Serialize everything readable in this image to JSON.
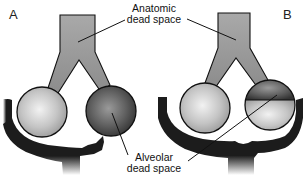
{
  "panels": [
    {
      "letter": "A"
    },
    {
      "letter": "B"
    }
  ],
  "labels": {
    "anatomic_line1": "Anatomic",
    "anatomic_line2": "dead space",
    "alveolar_line1": "Alveolar",
    "alveolar_line2": "dead space"
  },
  "colors": {
    "airway": "#8a8a8a",
    "alveolus_normal": "#c8c8c8",
    "alveolus_dead": "#5a5a5a",
    "blood_vessel": "#222222",
    "outline": "#111111"
  }
}
